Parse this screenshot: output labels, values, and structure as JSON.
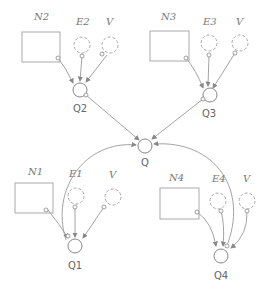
{
  "diagram": {
    "type": "directed-graph",
    "colors": {
      "line": "#999999",
      "node": "#888888",
      "label": "#777777"
    },
    "nodes": {
      "N1": {
        "label": "N1",
        "shape": "rect"
      },
      "N2": {
        "label": "N2",
        "shape": "rect"
      },
      "N3": {
        "label": "N3",
        "shape": "rect"
      },
      "N4": {
        "label": "N4",
        "shape": "rect"
      },
      "E1": {
        "label": "E1",
        "shape": "dashed-circle"
      },
      "E2": {
        "label": "E2",
        "shape": "dashed-circle"
      },
      "E3": {
        "label": "E3",
        "shape": "dashed-circle"
      },
      "E4": {
        "label": "E4",
        "shape": "dashed-circle"
      },
      "V1": {
        "label": "V",
        "shape": "dashed-circle"
      },
      "V2": {
        "label": "V",
        "shape": "dashed-circle"
      },
      "V3": {
        "label": "V",
        "shape": "dashed-circle"
      },
      "V4": {
        "label": "V",
        "shape": "dashed-circle"
      },
      "Q": {
        "label": "Q",
        "shape": "circle"
      },
      "Q1": {
        "label": "Q1",
        "shape": "circle"
      },
      "Q2": {
        "label": "Q2",
        "shape": "circle"
      },
      "Q3": {
        "label": "Q3",
        "shape": "circle"
      },
      "Q4": {
        "label": "Q4",
        "shape": "circle"
      }
    },
    "edges": [
      [
        "N2",
        "Q2"
      ],
      [
        "E2",
        "Q2"
      ],
      [
        "V2",
        "Q2"
      ],
      [
        "N3",
        "Q3"
      ],
      [
        "E3",
        "Q3"
      ],
      [
        "V3",
        "Q3"
      ],
      [
        "Q2",
        "Q"
      ],
      [
        "Q3",
        "Q"
      ],
      [
        "Q1",
        "Q"
      ],
      [
        "Q4",
        "Q"
      ],
      [
        "Q",
        "Q1"
      ],
      [
        "Q",
        "Q4"
      ],
      [
        "N1",
        "Q1"
      ],
      [
        "E1",
        "Q1"
      ],
      [
        "V1",
        "Q1"
      ],
      [
        "N4",
        "Q4"
      ],
      [
        "E4",
        "Q4"
      ],
      [
        "V4",
        "Q4"
      ]
    ]
  }
}
